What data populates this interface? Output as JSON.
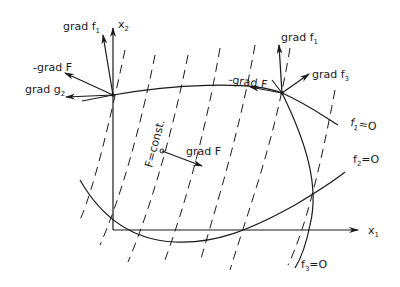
{
  "diagram": {
    "type": "constrained optimization gradient sketch",
    "axes": {
      "x_label": "x",
      "x_sub": "1",
      "y_label": "x",
      "y_sub": "2"
    },
    "left_point_labels": {
      "grad_f1": {
        "text": "grad f",
        "sub": "1"
      },
      "neg_grad_F": {
        "text": "-grad F"
      },
      "grad_g2": {
        "text": "grad g",
        "sub": "2"
      }
    },
    "right_point_labels": {
      "grad_f1": {
        "text": "grad f",
        "sub": "1"
      },
      "neg_grad_F": {
        "text": "-grad F"
      },
      "grad_f3": {
        "text": "grad f",
        "sub": "3"
      }
    },
    "center_labels": {
      "iso_line": "F=const.",
      "grad_F": "grad F"
    },
    "curves": {
      "f1": {
        "name": "f",
        "sub": "1",
        "eq": "=O"
      },
      "f2": {
        "name": "f",
        "sub": "2",
        "eq": "=O"
      },
      "f3": {
        "name": "f",
        "sub": "3",
        "eq": "=O"
      }
    },
    "colors": {
      "ink": "#1a1a1a",
      "background": "#ffffff"
    }
  }
}
